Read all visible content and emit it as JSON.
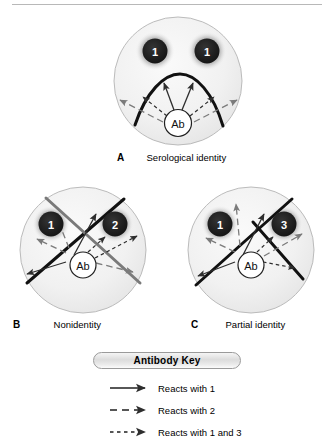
{
  "figure": {
    "title_rule": "horizontal-rule",
    "panels": [
      {
        "letter": "A",
        "caption": "Serological identity",
        "wells": [
          "1",
          "1"
        ],
        "center_well": "Ab"
      },
      {
        "letter": "B",
        "caption": "Nonidentity",
        "wells": [
          "1",
          "2"
        ],
        "center_well": "Ab"
      },
      {
        "letter": "C",
        "caption": "Partial identity",
        "wells": [
          "1",
          "3"
        ],
        "center_well": "Ab"
      }
    ]
  },
  "legend": {
    "title": "Antibody Key",
    "entries": [
      {
        "style": "solid",
        "label": "Reacts with 1"
      },
      {
        "style": "long-dash",
        "label": "Reacts with 2"
      },
      {
        "style": "short-dash",
        "label": "Reacts with 1 and 3"
      }
    ]
  },
  "colors": {
    "plate_fill": "#f0f0f0",
    "plate_stroke": "#b0b0b0",
    "well_fill": "#1c1c1c",
    "well_text": "#ffffff",
    "line_black": "#111111",
    "line_gray": "#7a7a7a",
    "arrow_dark": "#333333",
    "arrow_gray": "#777777",
    "background": "#ffffff"
  }
}
